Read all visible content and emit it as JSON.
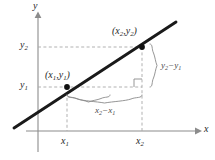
{
  "figure": {
    "axes": {
      "x_axis_label": "x",
      "y_axis_label": "y"
    },
    "ticks": {
      "x": [
        "x1",
        "x2"
      ],
      "y": [
        "y1",
        "y2"
      ],
      "x_display": [
        "x",
        "x"
      ],
      "y_display": [
        "y",
        "y"
      ],
      "x_sub": [
        "1",
        "2"
      ],
      "y_sub": [
        "1",
        "2"
      ]
    },
    "points": [
      {
        "name": "point-1",
        "label_open": "(",
        "label_x": "x",
        "label_x_sub": "1",
        "label_comma": ",",
        "label_y": "y",
        "label_y_sub": "1",
        "label_close": ")"
      },
      {
        "name": "point-2",
        "label_open": "(",
        "label_x": "x",
        "label_x_sub": "2",
        "label_comma": ",",
        "label_y": "y",
        "label_y_sub": "2",
        "label_close": ")"
      }
    ],
    "braces": {
      "vertical": {
        "name": "rise",
        "minuend": "y",
        "minuend_sub": "2",
        "operator": "−",
        "subtrahend": "y",
        "subtrahend_sub": "1"
      },
      "horizontal": {
        "name": "run",
        "minuend": "x",
        "minuend_sub": "2",
        "operator": "−",
        "subtrahend": "x",
        "subtrahend_sub": "1"
      }
    },
    "colors": {
      "background": "#ffffff",
      "line": "#1a1a1a",
      "axis": "#8c8c8c",
      "dashed_guide": "#a8a8a8",
      "brace": "#8a8a8a",
      "text": "#1f1f1f",
      "brace_text": "#4a4a4a",
      "point_fill": "#111111"
    }
  },
  "chart_data": {
    "type": "line",
    "xlabel": "x",
    "ylabel": "y",
    "grid": false,
    "legend": null,
    "annotations": [
      "(x2, y2)",
      "(x1, y1)",
      "y2 - y1",
      "x2 - x1",
      "right-angle marker"
    ],
    "series": [
      {
        "name": "line",
        "x": [
          0.12,
          1.0
        ],
        "y": [
          0.04,
          0.86
        ]
      }
    ],
    "points": [
      {
        "label": "(x1, y1)",
        "x": 0.34,
        "y": 0.38
      },
      {
        "label": "(x2, y2)",
        "x": 0.78,
        "y": 0.79
      }
    ],
    "xticks": [
      "x1",
      "x2"
    ],
    "yticks": [
      "y1",
      "y2"
    ]
  }
}
